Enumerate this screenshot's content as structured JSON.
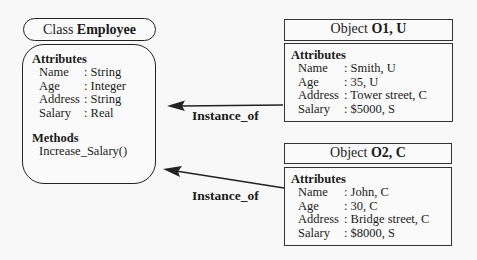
{
  "class_box": {
    "title_prefix": "Class ",
    "title_name": "Employee",
    "attributes_heading": "Attributes",
    "attributes": [
      {
        "name": "Name",
        "type": ": String"
      },
      {
        "name": "Age",
        "type": ": Integer"
      },
      {
        "name": "Address",
        "type": ": String"
      },
      {
        "name": "Salary",
        "type": ": Real"
      }
    ],
    "methods_heading": "Methods",
    "methods": [
      "Increase_Salary()"
    ]
  },
  "objects": [
    {
      "title_prefix": "Object ",
      "title_name": "O1, U",
      "attributes_heading": "Attributes",
      "attributes": [
        {
          "name": "Name",
          "value": ": Smith, U"
        },
        {
          "name": "Age",
          "value": ": 35, U"
        },
        {
          "name": "Address",
          "value": ": Tower street, C"
        },
        {
          "name": "Salary",
          "value": ": $5000, S"
        }
      ]
    },
    {
      "title_prefix": "Object ",
      "title_name": "O2, C",
      "attributes_heading": "Attributes",
      "attributes": [
        {
          "name": "Name",
          "value": ": John, C"
        },
        {
          "name": "Age",
          "value": ": 30, C"
        },
        {
          "name": "Address",
          "value": ": Bridge street, C"
        },
        {
          "name": "Salary",
          "value": ": $8000, S"
        }
      ]
    }
  ],
  "edges": [
    {
      "from": "Object O1, U",
      "to": "Class Employee",
      "label": "Instance_of"
    },
    {
      "from": "Object O2, C",
      "to": "Class Employee",
      "label": "Instance_of"
    }
  ],
  "colors": {
    "background": "#f8f8f8",
    "stroke": "#222222",
    "text": "#1a1a1a"
  }
}
